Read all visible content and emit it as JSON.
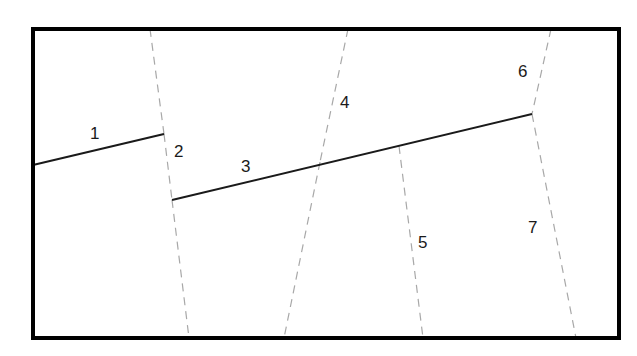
{
  "diagram": {
    "title": "",
    "canvas": {
      "width": 637,
      "height": 356,
      "background": "#ffffff"
    },
    "colors": {
      "border": "#000000",
      "solid_line": "#1a1a1a",
      "dashed_line": "#a8a8a8",
      "label": "#1a1a1a"
    },
    "frame": {
      "x": 33,
      "y": 29,
      "width": 586,
      "height": 309,
      "stroke_width": 4
    },
    "solid_segments": [
      {
        "id": "1",
        "x1": 33,
        "y1": 165,
        "x2": 164,
        "y2": 134
      },
      {
        "id": "3",
        "x1": 172,
        "y1": 200,
        "x2": 532,
        "y2": 114
      }
    ],
    "dashed_segments": [
      {
        "id": "A-top",
        "x1": 150,
        "y1": 29,
        "x2": 164,
        "y2": 134
      },
      {
        "id": "2",
        "x1": 164,
        "y1": 134,
        "x2": 172,
        "y2": 200
      },
      {
        "id": "A-bottom",
        "x1": 172,
        "y1": 200,
        "x2": 189,
        "y2": 338
      },
      {
        "id": "4",
        "x1": 348,
        "y1": 29,
        "x2": 320,
        "y2": 162
      },
      {
        "id": "B-bottom",
        "x1": 320,
        "y1": 162,
        "x2": 284,
        "y2": 338
      },
      {
        "id": "5",
        "x1": 399,
        "y1": 146,
        "x2": 423,
        "y2": 338
      },
      {
        "id": "6",
        "x1": 551,
        "y1": 29,
        "x2": 532,
        "y2": 114
      },
      {
        "id": "7",
        "x1": 532,
        "y1": 114,
        "x2": 576,
        "y2": 338
      }
    ],
    "labels": [
      {
        "text": "1",
        "x": 90,
        "y": 139
      },
      {
        "text": "2",
        "x": 174,
        "y": 157
      },
      {
        "text": "3",
        "x": 241,
        "y": 172
      },
      {
        "text": "4",
        "x": 340,
        "y": 108
      },
      {
        "text": "5",
        "x": 418,
        "y": 248
      },
      {
        "text": "6",
        "x": 518,
        "y": 77
      },
      {
        "text": "7",
        "x": 528,
        "y": 233
      }
    ]
  }
}
